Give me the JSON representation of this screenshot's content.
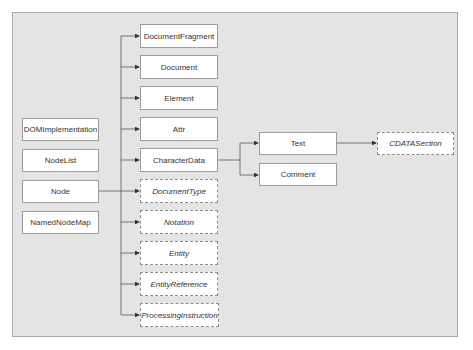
{
  "diagram": {
    "left_column": [
      {
        "label": "DOMImplementation",
        "style": "solid"
      },
      {
        "label": "NodeList",
        "style": "solid"
      },
      {
        "label": "Node",
        "style": "solid"
      },
      {
        "label": "NamedNodeMap",
        "style": "solid"
      }
    ],
    "node_children": [
      {
        "label": "DocumentFragment",
        "style": "solid"
      },
      {
        "label": "Document",
        "style": "solid"
      },
      {
        "label": "Element",
        "style": "solid"
      },
      {
        "label": "Attr",
        "style": "solid"
      },
      {
        "label": "CharacterData",
        "style": "solid"
      },
      {
        "label": "DocumentType",
        "style": "dashed"
      },
      {
        "label": "Notation",
        "style": "dashed"
      },
      {
        "label": "Entity",
        "style": "dashed"
      },
      {
        "label": "EntityReference",
        "style": "dashed"
      },
      {
        "label": "ProcessingInstruction",
        "style": "dashed"
      }
    ],
    "characterdata_children": [
      {
        "label": "Text",
        "style": "solid"
      },
      {
        "label": "Comment",
        "style": "solid"
      }
    ],
    "text_children": [
      {
        "label": "CDATASection",
        "style": "dashed"
      }
    ],
    "colors": {
      "panel_bg": "#e4e4e4",
      "box_bg": "#ffffff",
      "line": "#555555"
    }
  }
}
